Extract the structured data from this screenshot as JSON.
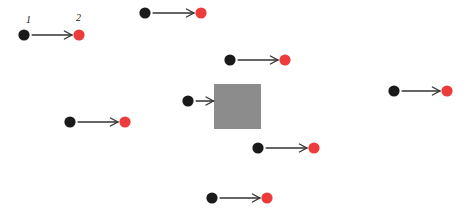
{
  "canvas": {
    "width": 471,
    "height": 212,
    "background_color": "#ffffff"
  },
  "palette": {
    "source_dot_color": "#1a1a1a",
    "target_dot_color": "#ed3b3b",
    "arrow_color": "#333333",
    "square_fill_color": "#8c8c8c",
    "label_color": "#151515"
  },
  "style": {
    "dot_radius": 5.6,
    "arrow_stroke_width": 1.3,
    "arrowhead_length": 7.5,
    "arrowhead_half_width": 4.0
  },
  "labels": [
    {
      "text": "1",
      "x": 26,
      "y": 15,
      "name": "label-1"
    },
    {
      "text": "2",
      "x": 76,
      "y": 13,
      "name": "label-2"
    }
  ],
  "square": {
    "name": "gray-square",
    "x": 214,
    "y": 84,
    "width": 47,
    "height": 45,
    "fill": "#8c8c8c"
  },
  "pairs": [
    {
      "name": "arrow-pair-1",
      "source": {
        "x": 24,
        "y": 35,
        "color": "#1a1a1a"
      },
      "target": {
        "x": 79,
        "y": 35,
        "color": "#ed3b3b"
      },
      "target_kind": "dot",
      "labeled": true
    },
    {
      "name": "arrow-pair-2",
      "source": {
        "x": 145,
        "y": 13,
        "color": "#1a1a1a"
      },
      "target": {
        "x": 201,
        "y": 13,
        "color": "#ed3b3b"
      },
      "target_kind": "dot",
      "labeled": false
    },
    {
      "name": "arrow-pair-3",
      "source": {
        "x": 230,
        "y": 60,
        "color": "#1a1a1a"
      },
      "target": {
        "x": 285,
        "y": 60,
        "color": "#ed3b3b"
      },
      "target_kind": "dot",
      "labeled": false
    },
    {
      "name": "arrow-pair-4",
      "source": {
        "x": 188,
        "y": 101,
        "color": "#1a1a1a"
      },
      "target": {
        "x": 214,
        "y": 101,
        "color": "#8c8c8c"
      },
      "target_kind": "square",
      "labeled": false
    },
    {
      "name": "arrow-pair-5",
      "source": {
        "x": 394,
        "y": 91,
        "color": "#1a1a1a"
      },
      "target": {
        "x": 447,
        "y": 91,
        "color": "#ed3b3b"
      },
      "target_kind": "dot",
      "labeled": false
    },
    {
      "name": "arrow-pair-6",
      "source": {
        "x": 70,
        "y": 122,
        "color": "#1a1a1a"
      },
      "target": {
        "x": 125,
        "y": 122,
        "color": "#ed3b3b"
      },
      "target_kind": "dot",
      "labeled": false
    },
    {
      "name": "arrow-pair-7",
      "source": {
        "x": 258,
        "y": 148,
        "color": "#1a1a1a"
      },
      "target": {
        "x": 314,
        "y": 148,
        "color": "#ed3b3b"
      },
      "target_kind": "dot",
      "labeled": false
    },
    {
      "name": "arrow-pair-8",
      "source": {
        "x": 212,
        "y": 198,
        "color": "#1a1a1a"
      },
      "target": {
        "x": 267,
        "y": 198,
        "color": "#ed3b3b"
      },
      "target_kind": "dot",
      "labeled": false
    }
  ]
}
